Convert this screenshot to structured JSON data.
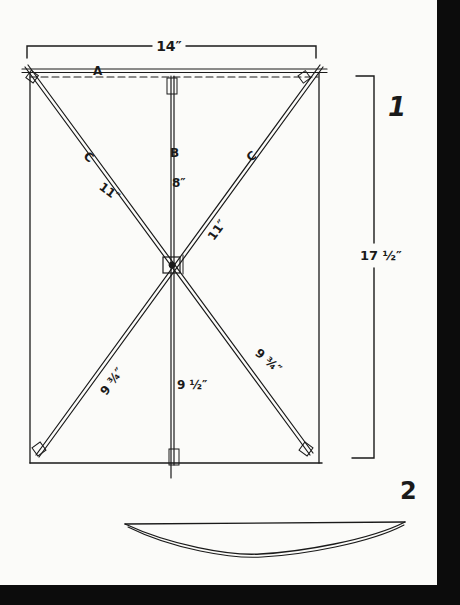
{
  "figure": {
    "colors": {
      "paper": "#fbfbf9",
      "ink": "#1a1a1a",
      "border": "#0c0c0c"
    },
    "figure_numbers": {
      "fig1": "1",
      "fig2": "2"
    },
    "dimensions": {
      "width": "14″",
      "height": "17 ½″"
    },
    "sticks": {
      "top_stick": "A",
      "vertical_stick": "B",
      "left_diagonal": "C",
      "right_diagonal": "C"
    },
    "segment_lengths": {
      "upper_left_diagonal": "11″",
      "upper_right_diagonal": "11″",
      "upper_vertical": "8″",
      "lower_left_diagonal": "9 ¾″",
      "lower_right_diagonal": "9 ¾″",
      "lower_vertical": "9 ½″"
    }
  }
}
